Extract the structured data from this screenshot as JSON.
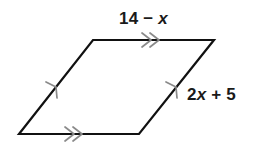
{
  "figure": {
    "type": "parallelogram",
    "background_color": "#ffffff",
    "stroke_color": "#111111",
    "stroke_width": 2.2,
    "tick_color": "#8a8a8a",
    "text_color": "#1a1a1a",
    "vertices": {
      "bottom_left": {
        "x": 19,
        "y": 134
      },
      "top_left": {
        "x": 93,
        "y": 40
      },
      "top_right": {
        "x": 214,
        "y": 40
      },
      "bottom_right": {
        "x": 139,
        "y": 134
      }
    },
    "sides": [
      {
        "name": "top-side",
        "from": "top_left",
        "to": "top_right",
        "tick_marks": 2,
        "tick_style": "double-chevron",
        "label": "14 - x"
      },
      {
        "name": "bottom-side",
        "from": "bottom_left",
        "to": "bottom_right",
        "tick_marks": 2,
        "tick_style": "double-chevron",
        "label": ""
      },
      {
        "name": "left-side",
        "from": "bottom_left",
        "to": "top_left",
        "tick_marks": 1,
        "tick_style": "single-chevron",
        "label": ""
      },
      {
        "name": "right-side",
        "from": "bottom_right",
        "to": "top_right",
        "tick_marks": 1,
        "tick_style": "single-chevron",
        "label": "2x + 5"
      }
    ]
  },
  "labels": {
    "top": {
      "full": "14 - x",
      "lead": "14",
      "operator": "−",
      "variable": "x"
    },
    "right": {
      "full": "2x + 5",
      "coefficient": "2",
      "variable": "x",
      "operator": "+",
      "constant": "5"
    }
  }
}
